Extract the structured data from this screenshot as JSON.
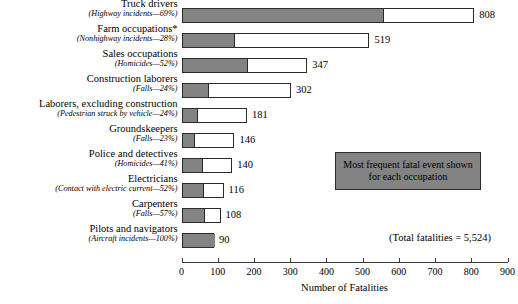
{
  "chart_data": {
    "type": "bar",
    "orientation": "horizontal",
    "title": "",
    "xlabel": "Number of Fatalities",
    "ylabel": "",
    "xlim": [
      0,
      900
    ],
    "xticks": [
      0,
      100,
      200,
      300,
      400,
      500,
      600,
      700,
      800,
      900
    ],
    "grid": false,
    "legend_position": "inside-right",
    "categories": [
      "Truck drivers",
      "Farm occupations*",
      "Sales occupations",
      "Construction laborers",
      "Laborers, excluding construction",
      "Groundskeepers",
      "Police and detectives",
      "Electricians",
      "Carpenters",
      "Pilots and navigators"
    ],
    "sublabels": [
      "(Highway incidents—69%)",
      "(Nonhighway incidents—28%)",
      "(Homicides—52%)",
      "(Falls—24%)",
      "(Pedestrian struck by vehicle—24%)",
      "(Falls—23%)",
      "(Homicides—41%)",
      "(Contact with electric current—52%)",
      "(Falls—57%)",
      "(Aircraft incidents—100%)"
    ],
    "values": [
      808,
      519,
      347,
      302,
      181,
      146,
      140,
      116,
      108,
      90
    ],
    "value_labels": [
      "808",
      "519",
      "347",
      "302",
      "181",
      "146",
      "140",
      "116",
      "108",
      "90"
    ],
    "event_names": [
      "Highway incidents",
      "Nonhighway incidents",
      "Homicides",
      "Falls",
      "Pedestrian struck by vehicle",
      "Falls",
      "Homicides",
      "Contact with electric current",
      "Falls",
      "Aircraft incidents"
    ],
    "event_percents": [
      69,
      28,
      52,
      24,
      24,
      23,
      41,
      52,
      57,
      100
    ],
    "series": [
      {
        "name": "Most frequent fatal event",
        "values": [
          557.5,
          145.3,
          180.4,
          72.5,
          43.4,
          33.6,
          57.4,
          60.3,
          61.6,
          90
        ]
      },
      {
        "name": "Other fatal events",
        "values": [
          250.5,
          373.7,
          166.6,
          229.5,
          137.6,
          112.4,
          82.6,
          55.7,
          46.4,
          0
        ]
      }
    ],
    "total_fatalities": 5524,
    "total_note": "(Total fatalities = 5,524)",
    "legend_text_line1": "Most frequent fatal event shown",
    "legend_text_line2": "for each occupation",
    "colors": {
      "highlight_fill": "#838383",
      "remainder_fill": "#ffffff",
      "bar_border": "#2a2a2a",
      "axis": "#3a3a3a",
      "text": "#000000"
    }
  }
}
